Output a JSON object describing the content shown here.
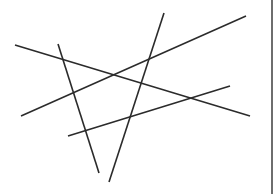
{
  "diagram": {
    "width": 274,
    "height": 194,
    "background": "#ffffff",
    "stroke_color": "#2b2b2b",
    "stroke_width": 1.6,
    "border": {
      "x": 272,
      "color": "#6e6e6e"
    },
    "segments": [
      {
        "id": "line-a",
        "x1": 15,
        "y1": 45,
        "x2": 250,
        "y2": 116
      },
      {
        "id": "line-b",
        "x1": 58,
        "y1": 44,
        "x2": 99,
        "y2": 173
      },
      {
        "id": "line-c",
        "x1": 164,
        "y1": 13,
        "x2": 109,
        "y2": 182
      },
      {
        "id": "line-d",
        "x1": 21,
        "y1": 116,
        "x2": 246,
        "y2": 16
      },
      {
        "id": "line-e",
        "x1": 68,
        "y1": 136,
        "x2": 230,
        "y2": 86
      }
    ]
  }
}
